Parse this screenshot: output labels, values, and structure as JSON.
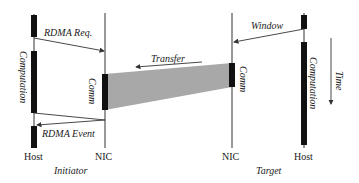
{
  "diagram": {
    "columns": {
      "initiator_host": "Host",
      "initiator_nic": "NIC",
      "target_nic": "NIC",
      "target_host": "Host"
    },
    "groups": {
      "initiator": "Initiator",
      "target": "Target"
    },
    "messages": {
      "rdma_req": "RDMA Req.",
      "transfer": "Transfer",
      "window": "Window",
      "rdma_event": "RDMA Event"
    },
    "blocks": {
      "initiator_computation": "Computation",
      "initiator_comm": "Comm",
      "target_comm": "Comm",
      "target_computation": "Computation"
    },
    "time_axis": "Time",
    "colors": {
      "line": "#333333",
      "block": "#111111",
      "transfer_fill": "#a8a8a8"
    }
  }
}
